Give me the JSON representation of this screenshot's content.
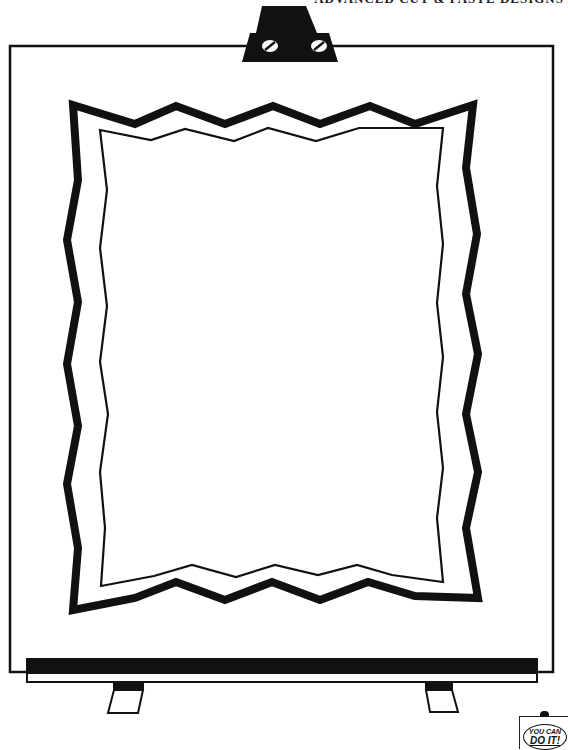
{
  "header": {
    "title": "ADVANCED CUT & PASTE DESIGNS"
  },
  "colors": {
    "ink": "#111111",
    "paper": "#ffffff"
  },
  "illustration": {
    "subject": "easel with blank board and zigzag double frame",
    "parts": [
      "easel-top-clamp",
      "screw-icon",
      "screw-icon",
      "board",
      "zigzag-frame-outer",
      "zigzag-frame-inner",
      "ledge",
      "leg",
      "leg"
    ]
  },
  "badge": {
    "line1": "YOU CAN",
    "line2": "DO IT!"
  }
}
